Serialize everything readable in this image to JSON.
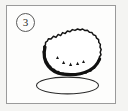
{
  "figure": {
    "index_label": "3",
    "caption": "",
    "frame": {
      "border_color": "#9a9a9a",
      "background_color": "#fdfdfc",
      "page_background_color": "#f4f4f2"
    }
  },
  "illustration": {
    "subject_name": "fuzzy-round-object",
    "style": "hand-drawn black line art with shaded underside",
    "ink_color": "#1a1a1a",
    "shadow_fill_color": "#4a4a4a",
    "body_fill_color": "#ffffff",
    "parts": [
      {
        "name": "spiky-body-outline",
        "description": "bumpy scalloped closed outline of a roughly oval fuzzy mass"
      },
      {
        "name": "shaded-underside-crescent",
        "description": "thick dark crescent of shading along the lower-left and bottom of the body"
      },
      {
        "name": "speckle-dots",
        "description": "small white dots scattered inside the dark shaded crescent"
      },
      {
        "name": "ground-ellipse",
        "description": "thin outlined ellipse beneath the body acting as base or cast shadow"
      }
    ]
  }
}
